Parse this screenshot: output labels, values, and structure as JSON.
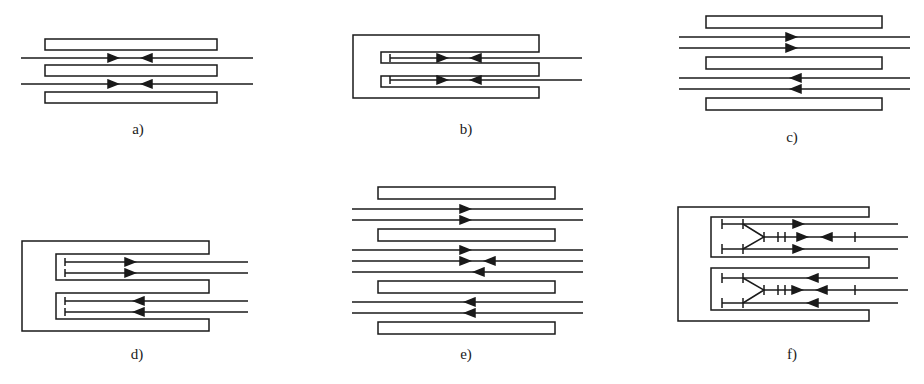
{
  "figure": {
    "stroke_color": "#1a1a1a",
    "background": "#ffffff",
    "panels": [
      {
        "id": "a",
        "label": "a)",
        "type": "three parallel plates, two lines with opposing arrows meeting in center"
      },
      {
        "id": "b",
        "label": "b)",
        "type": "E-shaped enclosure, two terminated lines with opposing arrows"
      },
      {
        "id": "c",
        "label": "c)",
        "type": "three parallel plates, two pairs of lines: upper pair right arrows, lower pair left arrows"
      },
      {
        "id": "d",
        "label": "d)",
        "type": "E-shaped enclosure, upper pair right arrows, lower pair left arrows, terminated"
      },
      {
        "id": "e",
        "label": "e)",
        "type": "four parallel plates, seven lines with mixed arrow directions"
      },
      {
        "id": "f",
        "label": "f)",
        "type": "E-shaped enclosure with branching Y-junction lines and tick marks"
      }
    ]
  }
}
